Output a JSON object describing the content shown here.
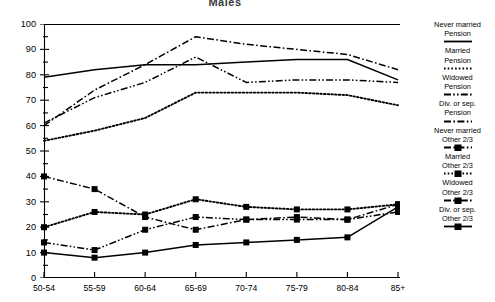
{
  "chart_data": {
    "type": "line",
    "title": "Males",
    "xlabel": "",
    "ylabel": "",
    "categories": [
      "50-54",
      "55-59",
      "60-64",
      "65-69",
      "70-74",
      "75-79",
      "80-84",
      "85+"
    ],
    "ylim": [
      0,
      100
    ],
    "ytick_labels": [
      "0",
      "10",
      "20",
      "30",
      "40",
      "50",
      "60",
      "70",
      "80",
      "90",
      "100"
    ],
    "ytick_values": [
      0,
      10,
      20,
      30,
      40,
      50,
      60,
      70,
      80,
      90,
      100
    ],
    "yminor_step": 5,
    "grid": false,
    "legend_position": "right",
    "series": [
      {
        "name": "Never married Pension",
        "label_line1": "Never married",
        "label_line2": "Pension",
        "style": "solid",
        "marker": "none",
        "values": [
          79,
          82,
          84,
          84,
          85,
          86,
          86,
          78
        ]
      },
      {
        "name": "Married Pension",
        "label_line1": "Married",
        "label_line2": "Pension",
        "style": "dotted",
        "marker": "none",
        "values": [
          54,
          58,
          63,
          73,
          73,
          73,
          72,
          68
        ]
      },
      {
        "name": "Widowed Pension",
        "label_line1": "Widowed",
        "label_line2": "Pension",
        "style": "dash-dot-dot",
        "marker": "none",
        "values": [
          61,
          71,
          77,
          87,
          77,
          78,
          78,
          77
        ]
      },
      {
        "name": "Div. or sep. Pension",
        "label_line1": "Div. or sep.",
        "label_line2": "Pension",
        "style": "dash-dot",
        "marker": "none",
        "values": [
          60,
          74,
          84,
          95,
          92,
          90,
          88,
          82
        ]
      },
      {
        "name": "Never married Other 2/3",
        "label_line1": "Never married",
        "label_line2": "Other 2/3",
        "style": "dash-dot",
        "marker": "square",
        "values": [
          40,
          35,
          24,
          19,
          23,
          24,
          23,
          29
        ]
      },
      {
        "name": "Married Other 2/3",
        "label_line1": "Married",
        "label_line2": "Other 2/3",
        "style": "dotted",
        "marker": "square",
        "values": [
          20,
          26,
          25,
          31,
          28,
          27,
          27,
          29
        ]
      },
      {
        "name": "Widowed Other 2/3",
        "label_line1": "Widowed",
        "label_line2": "Other 2/3",
        "style": "dash-dot-dot",
        "marker": "square",
        "values": [
          14,
          11,
          19,
          24,
          23,
          23,
          23,
          26
        ]
      },
      {
        "name": "Div. or sep. Other 2/3",
        "label_line1": "Div. or sep.",
        "label_line2": "Other 2/3",
        "style": "solid",
        "marker": "square",
        "values": [
          10,
          8,
          10,
          13,
          14,
          15,
          16,
          28
        ]
      }
    ]
  }
}
